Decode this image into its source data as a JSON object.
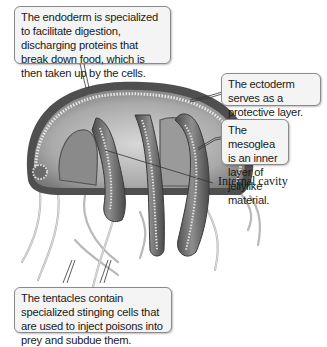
{
  "figure": {
    "callouts": {
      "endoderm": "The endoderm is specialized to facilitate digestion, discharging proteins that break down food, which is then taken up by the cells.",
      "ectoderm": "The ectoderm serves as a protective layer.",
      "mesoglea": "The mesoglea is an inner layer of jellylike material.",
      "tentacles": "The tentacles contain specialized stinging cells that are used to inject poisons into prey and subdue them."
    },
    "labels": {
      "internal_cavity": "Internal cavity"
    },
    "colors": {
      "callout_bg": "#f4f4f4",
      "callout_border": "#8a8a8a",
      "bell_dark": "#555555",
      "bell_light": "#cfcfcf",
      "leader_line": "#333333"
    }
  }
}
